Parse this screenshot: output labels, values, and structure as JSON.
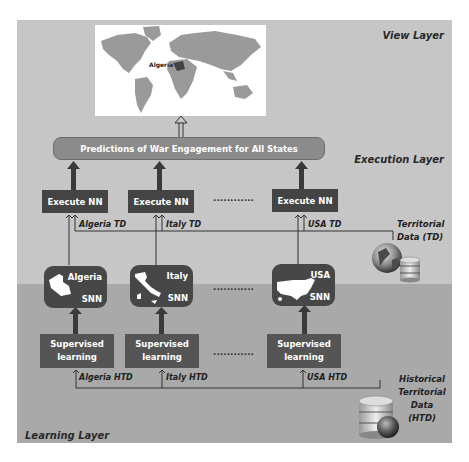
{
  "layers": {
    "view": "View Layer",
    "execution": "Execution Layer",
    "learning": "Learning Layer"
  },
  "map": {
    "highlight_label": "Algeria",
    "land_color": "#9a9a9a",
    "highlight_color": "#444444"
  },
  "predictions": {
    "label": "Predictions of War Engagement for All States"
  },
  "execute_nodes": [
    {
      "label": "Execute NN",
      "input_label": "Algeria TD"
    },
    {
      "label": "Execute NN",
      "input_label": "Italy TD"
    },
    {
      "label": "Execute NN",
      "input_label": "USA TD"
    }
  ],
  "snn_nodes": [
    {
      "country": "Algeria",
      "tag": "SNN"
    },
    {
      "country": "Italy",
      "tag": "SNN"
    },
    {
      "country": "USA",
      "tag": "SNN"
    }
  ],
  "supervised_nodes": [
    {
      "line1": "Supervised",
      "line2": "learning",
      "input_label": "Algeria HTD"
    },
    {
      "line1": "Supervised",
      "line2": "learning",
      "input_label": "Italy HTD"
    },
    {
      "line1": "Supervised",
      "line2": "learning",
      "input_label": "USA HTD"
    }
  ],
  "ellipsis": "............",
  "territorial_data": {
    "line1": "Territorial",
    "line2": "Data (TD)"
  },
  "historical_data": {
    "line1": "Historical",
    "line2": "Territorial",
    "line3": "Data",
    "line4": "(HTD)"
  },
  "colors": {
    "upper_bg": "#c6c6c6",
    "lower_bg": "#a9a9a9",
    "node_dark": "#444444",
    "pill": "#8b8b8b"
  }
}
